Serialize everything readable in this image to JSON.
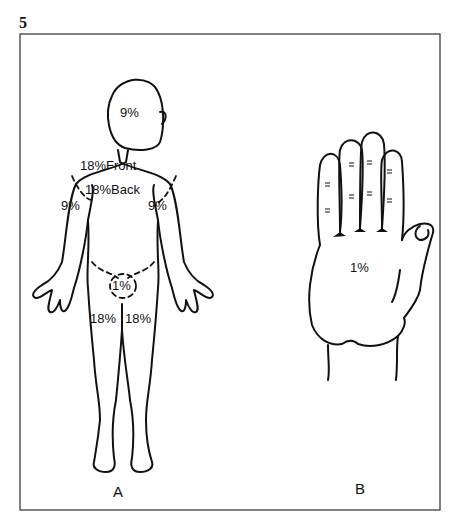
{
  "figure": {
    "number": "5",
    "panels": {
      "a_label": "A",
      "b_label": "B"
    },
    "body_labels": {
      "head": "9%",
      "trunk_front": "18%Front",
      "trunk_back": "18%Back",
      "arm_right": "9%",
      "arm_left": "9%",
      "perineum": "1%",
      "leg_right": "18%",
      "leg_left": "18%"
    },
    "hand_label": "1%",
    "colors": {
      "line": "#111111",
      "frame": "#555555",
      "background": "#ffffff"
    }
  }
}
